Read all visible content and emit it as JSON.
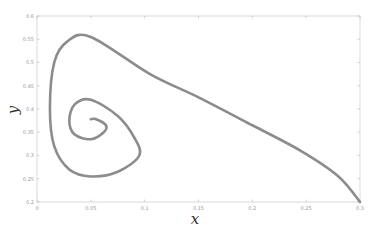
{
  "chart_data": {
    "type": "line",
    "title": "",
    "xlabel": "x",
    "ylabel": "y",
    "xlim": [
      0,
      0.3
    ],
    "ylim": [
      0.2,
      0.6
    ],
    "grid": false,
    "legend": null,
    "x_ticks": [
      "0",
      "0.05",
      "0.1",
      "0.15",
      "0.2",
      "0.25",
      "0.3"
    ],
    "y_ticks": [
      "0.2",
      "0.25",
      "0.3",
      "0.35",
      "0.4",
      "0.45",
      "0.5",
      "0.55",
      "0.6"
    ],
    "series": [
      {
        "name": "trajectory",
        "color": "#8c8c8c",
        "points": [
          [
            0.3,
            0.2
          ],
          [
            0.28,
            0.255
          ],
          [
            0.245,
            0.31
          ],
          [
            0.2,
            0.365
          ],
          [
            0.15,
            0.425
          ],
          [
            0.105,
            0.475
          ],
          [
            0.05,
            0.555
          ],
          [
            0.028,
            0.545
          ],
          [
            0.016,
            0.5
          ],
          [
            0.012,
            0.4
          ],
          [
            0.016,
            0.32
          ],
          [
            0.03,
            0.27
          ],
          [
            0.05,
            0.255
          ],
          [
            0.075,
            0.265
          ],
          [
            0.095,
            0.3
          ],
          [
            0.09,
            0.34
          ],
          [
            0.075,
            0.385
          ],
          [
            0.05,
            0.42
          ],
          [
            0.035,
            0.41
          ],
          [
            0.03,
            0.375
          ],
          [
            0.035,
            0.345
          ],
          [
            0.05,
            0.335
          ],
          [
            0.062,
            0.35
          ],
          [
            0.064,
            0.365
          ],
          [
            0.055,
            0.378
          ],
          [
            0.05,
            0.378
          ]
        ]
      }
    ]
  },
  "labels": {
    "x": "x",
    "y": "y"
  }
}
